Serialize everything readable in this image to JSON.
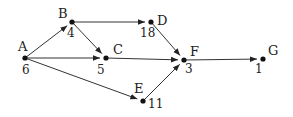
{
  "diagram": {
    "type": "directed-graph",
    "nodes": [
      {
        "id": "A",
        "label": "A",
        "weight": "6",
        "x": 25,
        "y": 58,
        "lx": 18,
        "ly": 51,
        "wx": 22,
        "wy": 74
      },
      {
        "id": "B",
        "label": "B",
        "weight": "4",
        "x": 72,
        "y": 22,
        "lx": 58,
        "ly": 18,
        "wx": 67,
        "wy": 37
      },
      {
        "id": "C",
        "label": "C",
        "weight": "5",
        "x": 106,
        "y": 58,
        "lx": 113,
        "ly": 54,
        "wx": 97,
        "wy": 74
      },
      {
        "id": "D",
        "label": "D",
        "weight": "18",
        "x": 151,
        "y": 22,
        "lx": 157,
        "ly": 25,
        "wx": 140,
        "wy": 37
      },
      {
        "id": "E",
        "label": "E",
        "weight": "11",
        "x": 143,
        "y": 101,
        "lx": 134,
        "ly": 93,
        "wx": 148,
        "wy": 108
      },
      {
        "id": "F",
        "label": "F",
        "weight": "3",
        "x": 184,
        "y": 60,
        "lx": 190,
        "ly": 56,
        "wx": 185,
        "wy": 73
      },
      {
        "id": "G",
        "label": "G",
        "weight": "1",
        "x": 263,
        "y": 59,
        "lx": 268,
        "ly": 55,
        "wx": 255,
        "wy": 73
      }
    ],
    "edges": [
      {
        "from": "A",
        "to": "B"
      },
      {
        "from": "A",
        "to": "C"
      },
      {
        "from": "A",
        "to": "E"
      },
      {
        "from": "B",
        "to": "C"
      },
      {
        "from": "B",
        "to": "D"
      },
      {
        "from": "C",
        "to": "F"
      },
      {
        "from": "D",
        "to": "F"
      },
      {
        "from": "E",
        "to": "F"
      },
      {
        "from": "F",
        "to": "G"
      }
    ]
  }
}
